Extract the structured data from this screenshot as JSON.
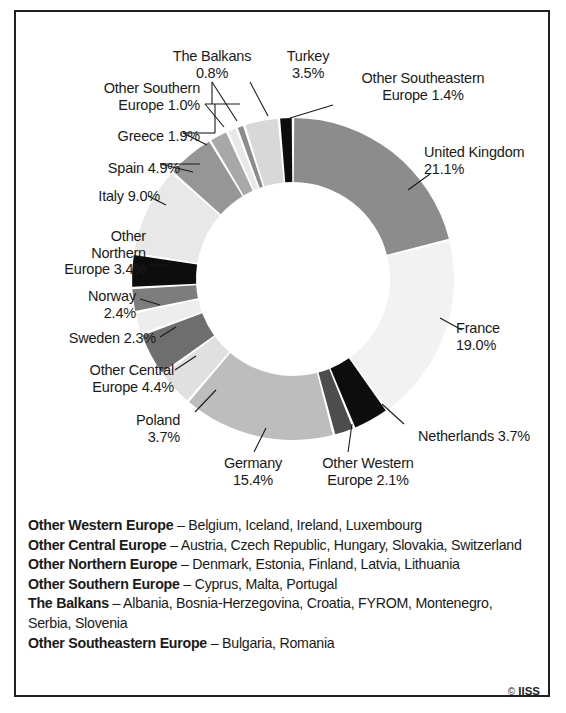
{
  "chart_data": {
    "type": "pie",
    "variant": "donut",
    "title": "",
    "subtitle": "",
    "xlabel": "",
    "ylabel": "",
    "unit": "%",
    "legend_position": "callout-labels",
    "grid": false,
    "start_angle_deg": 0,
    "direction": "clockwise",
    "categories": [
      "United Kingdom",
      "France",
      "Netherlands",
      "Other Western Europe",
      "Germany",
      "Poland",
      "Other Central Europe",
      "Sweden",
      "Norway",
      "Other Northern Europe",
      "Italy",
      "Spain",
      "Greece",
      "Other Southern Europe",
      "The Balkans",
      "Turkey",
      "Other Southeastern Europe"
    ],
    "values": [
      21.1,
      19.0,
      3.7,
      2.1,
      15.4,
      3.7,
      4.4,
      2.3,
      2.4,
      3.4,
      9.0,
      4.9,
      1.9,
      1.0,
      0.8,
      3.5,
      1.4
    ],
    "colors": [
      "#8c8c8c",
      "#f2f2f2",
      "#0d0d0d",
      "#4d4d4d",
      "#bdbdbd",
      "#e0e0e0",
      "#6e6e6e",
      "#ededed",
      "#7d7d7d",
      "#0d0d0d",
      "#e8e8e8",
      "#969696",
      "#a8a8a8",
      "#e8e8e8",
      "#8c8c8c",
      "#d8d8d8",
      "#0d0d0d"
    ],
    "slices": [
      {
        "label": "United Kingdom",
        "value": 21.1,
        "display": "21.1%",
        "color": "#8c8c8c"
      },
      {
        "label": "France",
        "value": 19.0,
        "display": "19.0%",
        "color": "#f2f2f2"
      },
      {
        "label": "Netherlands",
        "value": 3.7,
        "display": "3.7%",
        "color": "#0d0d0d"
      },
      {
        "label": "Other Western Europe",
        "value": 2.1,
        "display": "2.1%",
        "color": "#4d4d4d"
      },
      {
        "label": "Germany",
        "value": 15.4,
        "display": "15.4%",
        "color": "#bdbdbd"
      },
      {
        "label": "Poland",
        "value": 3.7,
        "display": "3.7%",
        "color": "#e0e0e0"
      },
      {
        "label": "Other Central Europe",
        "value": 4.4,
        "display": "4.4%",
        "color": "#6e6e6e"
      },
      {
        "label": "Sweden",
        "value": 2.3,
        "display": "2.3%",
        "color": "#ededed"
      },
      {
        "label": "Norway",
        "value": 2.4,
        "display": "2.4%",
        "color": "#7d7d7d"
      },
      {
        "label": "Other Northern Europe",
        "value": 3.4,
        "display": "3.4%",
        "color": "#0d0d0d"
      },
      {
        "label": "Italy",
        "value": 9.0,
        "display": "9.0%",
        "color": "#e8e8e8"
      },
      {
        "label": "Spain",
        "value": 4.9,
        "display": "4.9%",
        "color": "#969696"
      },
      {
        "label": "Greece",
        "value": 1.9,
        "display": "1.9%",
        "color": "#a8a8a8"
      },
      {
        "label": "Other Southern Europe",
        "value": 1.0,
        "display": "1.0%",
        "color": "#e8e8e8"
      },
      {
        "label": "The Balkans",
        "value": 0.8,
        "display": "0.8%",
        "color": "#8c8c8c"
      },
      {
        "label": "Turkey",
        "value": 3.5,
        "display": "3.5%",
        "color": "#d8d8d8"
      },
      {
        "label": "Other Southeastern Europe",
        "value": 1.4,
        "display": "1.4%",
        "color": "#0d0d0d"
      }
    ]
  },
  "callouts": {
    "the_balkans": "The Balkans\n0.8%",
    "turkey": "Turkey\n3.5%",
    "other_southeastern_europe": "Other Southeastern\nEurope 1.4%",
    "other_southern_europe": "Other Southern\nEurope 1.0%",
    "greece": "Greece 1.9%",
    "spain": "Spain 4.9%",
    "italy": "Italy 9.0%",
    "other_northern_europe": "Other\nNorthern\nEurope 3.4%",
    "norway": "Norway\n2.4%",
    "sweden": "Sweden 2.3%",
    "other_central_europe": "Other Central\nEurope 4.4%",
    "poland": "Poland\n3.7%",
    "germany": "Germany\n15.4%",
    "other_western_europe": "Other Western\nEurope 2.1%",
    "netherlands": "Netherlands 3.7%",
    "france": "France\n19.0%",
    "united_kingdom": "United Kingdom\n21.1%"
  },
  "footnotes": [
    {
      "term": "Other Western Europe",
      "dash": " – ",
      "list": "Belgium, Iceland, Ireland, Luxembourg"
    },
    {
      "term": "Other Central Europe",
      "dash": " – ",
      "list": "Austria, Czech Republic, Hungary, Slovakia, Switzerland"
    },
    {
      "term": "Other Northern Europe",
      "dash": " – ",
      "list": "Denmark, Estonia, Finland, Latvia, Lithuania"
    },
    {
      "term": "Other Southern Europe",
      "dash": " – ",
      "list": "Cyprus, Malta, Portugal"
    },
    {
      "term": "The Balkans",
      "dash": " – ",
      "list": "Albania, Bosnia-Herzegovina, Croatia, FYROM, Montenegro, Serbia, Slovenia"
    },
    {
      "term": "Other Southeastern Europe",
      "dash": " – ",
      "list": "Bulgaria, Romania"
    }
  ],
  "credit": {
    "mark": "©",
    "text": "IISS"
  }
}
